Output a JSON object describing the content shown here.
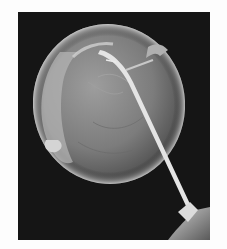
{
  "figure": {
    "background_color": "#151515",
    "cell_color": "#8f8f8f",
    "needle_color": "#e6e6e6"
  },
  "caption": {
    "text": ""
  }
}
